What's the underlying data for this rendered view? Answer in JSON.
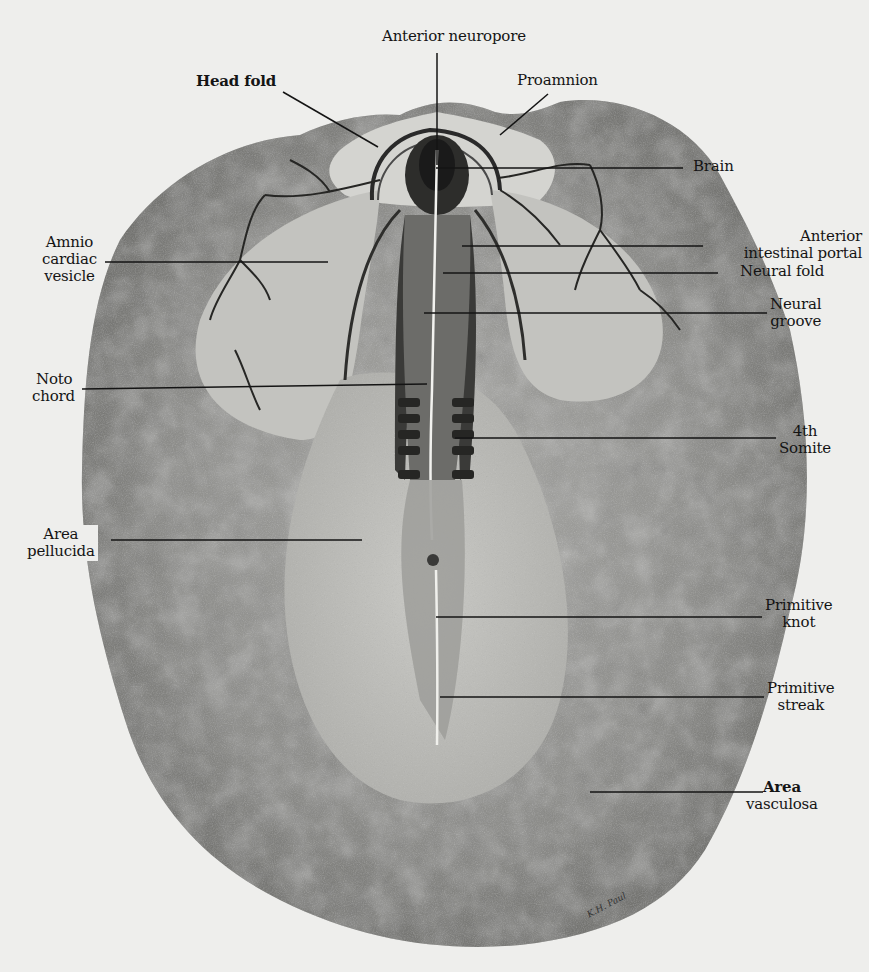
{
  "figure": {
    "background_color": "#eeeeec",
    "ink_color": "#141414",
    "signature": "K.H. Paul"
  },
  "labels": {
    "anterior_neuropore": "Anterior neuropore",
    "head_fold": "Head fold",
    "proamnion": "Proamnion",
    "brain": "Brain",
    "amnio_cardiac_vesicle": [
      "Amnio",
      "cardiac",
      "vesicle"
    ],
    "anterior_intestinal_portal": [
      "Anterior",
      "intestinal portal"
    ],
    "neural_fold": "Neural fold",
    "neural_groove": [
      "Neural",
      "groove"
    ],
    "notochord": [
      "Noto",
      "chord"
    ],
    "fourth_somite": [
      "4th",
      "Somite"
    ],
    "area_pellucida": [
      "Area",
      "pellucida"
    ],
    "primitive_knot": [
      "Primitive",
      "knot"
    ],
    "primitive_streak": [
      "Primitive",
      "streak"
    ],
    "area_vasculosa": [
      "Area",
      "vasculosa"
    ]
  },
  "leader_lines": [
    {
      "label": "Anterior neuropore",
      "x1": 437,
      "y1": 53,
      "x2": 437,
      "y2": 165
    },
    {
      "label": "Head fold",
      "x1": 283,
      "y1": 92,
      "x2": 378,
      "y2": 147
    },
    {
      "label": "Proamnion",
      "x1": 548,
      "y1": 94,
      "x2": 500,
      "y2": 135
    },
    {
      "label": "Brain",
      "x1": 436,
      "y1": 168,
      "x2": 683,
      "y2": 168
    },
    {
      "label": "Amnio cardiac vesicle",
      "x1": 105,
      "y1": 262,
      "x2": 328,
      "y2": 262
    },
    {
      "label": "Anterior intestinal portal",
      "x1": 462,
      "y1": 246,
      "x2": 703,
      "y2": 246
    },
    {
      "label": "Neural fold",
      "x1": 443,
      "y1": 273,
      "x2": 718,
      "y2": 273
    },
    {
      "label": "Neural groove",
      "x1": 424,
      "y1": 313,
      "x2": 767,
      "y2": 313
    },
    {
      "label": "Notochord",
      "x1": 82,
      "y1": 389,
      "x2": 427,
      "y2": 384
    },
    {
      "label": "4th Somite",
      "x1": 455,
      "y1": 438,
      "x2": 776,
      "y2": 438
    },
    {
      "label": "Area pellucida",
      "x1": 111,
      "y1": 540,
      "x2": 362,
      "y2": 540
    },
    {
      "label": "Primitive knot",
      "x1": 436,
      "y1": 617,
      "x2": 762,
      "y2": 617
    },
    {
      "label": "Primitive streak",
      "x1": 440,
      "y1": 697,
      "x2": 764,
      "y2": 697
    },
    {
      "label": "Area vasculosa",
      "x1": 590,
      "y1": 792,
      "x2": 763,
      "y2": 792
    }
  ]
}
